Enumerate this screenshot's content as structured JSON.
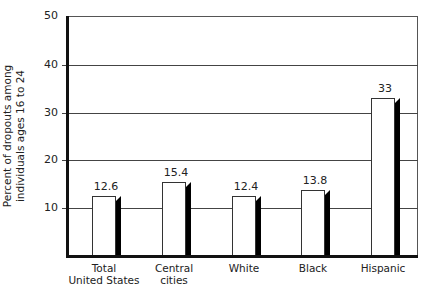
{
  "chart_data": {
    "type": "bar",
    "title": "",
    "xlabel": "",
    "ylabel": "Percent of dropouts among individuals ages 16 to 24",
    "ylabel_lines": [
      "Percent of dropouts among",
      "individuals ages 16 to 24"
    ],
    "categories": [
      "Total United States",
      "Central cities",
      "White",
      "Black",
      "Hispanic"
    ],
    "category_lines": [
      [
        "Total",
        "United States"
      ],
      [
        "Central",
        "cities"
      ],
      [
        "White"
      ],
      [
        "Black"
      ],
      [
        "Hispanic"
      ]
    ],
    "values": [
      12.6,
      15.4,
      12.4,
      13.8,
      33
    ],
    "value_labels": [
      "12.6",
      "15.4",
      "12.4",
      "13.8",
      "33"
    ],
    "ylim": [
      0,
      50
    ],
    "yticks": [
      10,
      20,
      30,
      40,
      50
    ],
    "ytick_labels": [
      "10",
      "20",
      "30",
      "40",
      "50"
    ],
    "grid": true,
    "legend": null,
    "bar_color": "#ffffff",
    "shadow_color": "#000000"
  }
}
